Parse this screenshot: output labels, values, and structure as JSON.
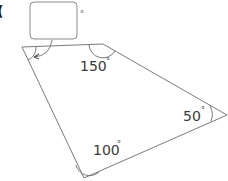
{
  "diagram": {
    "type": "quadrilateral-angles",
    "part_label": "(",
    "answer_box": {
      "value": "",
      "unit": "°"
    },
    "angles": [
      {
        "vertex": "top-left",
        "value": "?",
        "unknown": true
      },
      {
        "vertex": "top-right",
        "value": "150",
        "unit": "°"
      },
      {
        "vertex": "right",
        "value": "50",
        "unit": "°"
      },
      {
        "vertex": "bottom",
        "value": "100",
        "unit": "°"
      }
    ],
    "colors": {
      "line": "#7a7a7a",
      "text": "#3a3a3a",
      "box": "#8a8a8a"
    }
  }
}
